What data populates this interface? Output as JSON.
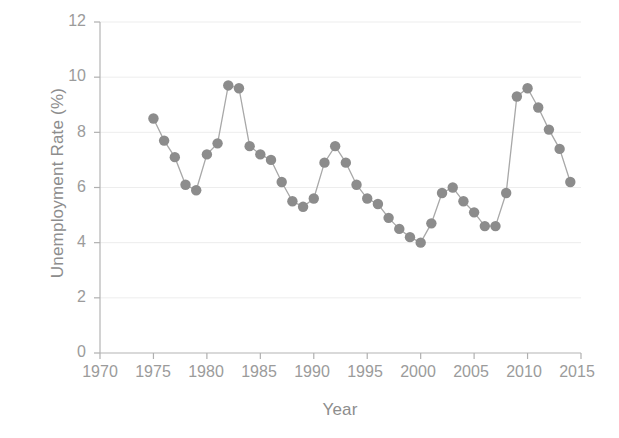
{
  "chart_data": {
    "type": "line",
    "title": "",
    "xlabel": "Year",
    "ylabel": "Unemployment Rate (%)",
    "xlim": [
      1970,
      2015
    ],
    "ylim": [
      0,
      12
    ],
    "xticks": [
      1970,
      1975,
      1980,
      1985,
      1990,
      1995,
      2000,
      2005,
      2010,
      2015
    ],
    "yticks": [
      0,
      2,
      4,
      6,
      8,
      10,
      12
    ],
    "grid": "faint horizontal gridlines at y ticks",
    "legend": "none",
    "marker": "filled circle",
    "marker_color": "#8c8c8c",
    "line_color": "#a8a8a8",
    "x": [
      1975,
      1976,
      1977,
      1978,
      1979,
      1980,
      1981,
      1982,
      1983,
      1984,
      1985,
      1986,
      1987,
      1988,
      1989,
      1990,
      1991,
      1992,
      1993,
      1994,
      1995,
      1996,
      1997,
      1998,
      1999,
      2000,
      2001,
      2002,
      2003,
      2004,
      2005,
      2006,
      2007,
      2008,
      2009,
      2010,
      2011,
      2012,
      2013,
      2014
    ],
    "values": [
      8.5,
      7.7,
      7.1,
      6.1,
      5.9,
      7.2,
      7.6,
      9.7,
      9.6,
      7.5,
      7.2,
      7.0,
      6.2,
      5.5,
      5.3,
      5.6,
      6.9,
      7.5,
      6.9,
      6.1,
      5.6,
      5.4,
      4.9,
      4.5,
      4.2,
      4.0,
      4.7,
      5.8,
      6.0,
      5.5,
      5.1,
      4.6,
      4.6,
      5.8,
      9.3,
      9.6,
      8.9,
      8.1,
      7.4,
      6.2
    ],
    "series": [
      {
        "name": "Unemployment Rate",
        "values": [
          8.5,
          7.7,
          7.1,
          6.1,
          5.9,
          7.2,
          7.6,
          9.7,
          9.6,
          7.5,
          7.2,
          7.0,
          6.2,
          5.5,
          5.3,
          5.6,
          6.9,
          7.5,
          6.9,
          6.1,
          5.6,
          5.4,
          4.9,
          4.5,
          4.2,
          4.0,
          4.7,
          5.8,
          6.0,
          5.5,
          5.1,
          4.6,
          4.6,
          5.8,
          9.3,
          9.6,
          8.9,
          8.1,
          7.4,
          6.2
        ]
      }
    ]
  },
  "axes": {
    "y_label": "Unemployment Rate (%)",
    "x_label": "Year",
    "y_tick_labels": [
      "12",
      "10",
      "8",
      "6",
      "4",
      "2",
      "0"
    ],
    "x_tick_labels": [
      "1970",
      "1975",
      "1980",
      "1985",
      "1990",
      "1995",
      "2000",
      "2005",
      "2010",
      "2015"
    ]
  },
  "footer": {
    "smudge_text": ""
  },
  "colors": {
    "marker": "#8c8c8c",
    "line": "#a8a8a8",
    "axis": "#b0b0b0",
    "grid": "#ededed",
    "text": "#8d8d8d"
  }
}
